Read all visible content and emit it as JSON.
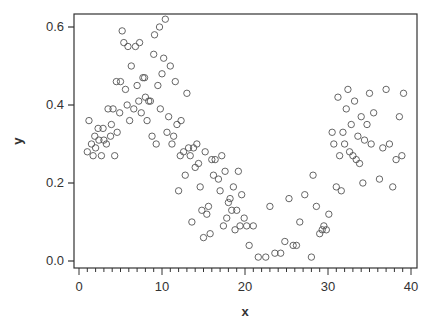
{
  "chart_data": {
    "type": "scatter",
    "title": "",
    "xlabel": "x",
    "ylabel": "y",
    "xlim": [
      -0.5,
      40.5
    ],
    "ylim": [
      -0.02,
      0.64
    ],
    "xticks": [
      0,
      10,
      20,
      30,
      40
    ],
    "xtick_labels": [
      "0",
      "10",
      "20",
      "30",
      "40"
    ],
    "yticks": [
      0.0,
      0.2,
      0.4,
      0.6
    ],
    "ytick_labels": [
      "0.0",
      "0.2",
      "0.4",
      "0.6"
    ],
    "x_minor_step": 1,
    "grid": false,
    "legend": null,
    "marker": "open-circle",
    "marker_color": "#555555",
    "points": [
      [
        1.0,
        0.28
      ],
      [
        1.2,
        0.36
      ],
      [
        1.5,
        0.3
      ],
      [
        1.7,
        0.27
      ],
      [
        1.9,
        0.32
      ],
      [
        2.0,
        0.29
      ],
      [
        2.3,
        0.34
      ],
      [
        2.4,
        0.31
      ],
      [
        2.7,
        0.27
      ],
      [
        2.9,
        0.34
      ],
      [
        3.0,
        0.31
      ],
      [
        3.3,
        0.3
      ],
      [
        3.5,
        0.39
      ],
      [
        3.8,
        0.32
      ],
      [
        3.9,
        0.35
      ],
      [
        4.1,
        0.39
      ],
      [
        4.3,
        0.27
      ],
      [
        4.5,
        0.46
      ],
      [
        4.6,
        0.33
      ],
      [
        4.9,
        0.38
      ],
      [
        5.0,
        0.46
      ],
      [
        5.2,
        0.59
      ],
      [
        5.4,
        0.56
      ],
      [
        5.6,
        0.44
      ],
      [
        5.8,
        0.4
      ],
      [
        5.9,
        0.55
      ],
      [
        6.1,
        0.36
      ],
      [
        6.3,
        0.5
      ],
      [
        6.6,
        0.39
      ],
      [
        6.8,
        0.55
      ],
      [
        7.0,
        0.45
      ],
      [
        7.2,
        0.41
      ],
      [
        7.3,
        0.56
      ],
      [
        7.5,
        0.38
      ],
      [
        7.7,
        0.47
      ],
      [
        7.9,
        0.47
      ],
      [
        8.0,
        0.42
      ],
      [
        8.2,
        0.36
      ],
      [
        8.4,
        0.41
      ],
      [
        8.6,
        0.41
      ],
      [
        8.8,
        0.32
      ],
      [
        9.0,
        0.53
      ],
      [
        9.1,
        0.58
      ],
      [
        9.3,
        0.3
      ],
      [
        9.5,
        0.45
      ],
      [
        9.7,
        0.6
      ],
      [
        9.8,
        0.39
      ],
      [
        10.0,
        0.48
      ],
      [
        10.2,
        0.52
      ],
      [
        10.4,
        0.62
      ],
      [
        10.6,
        0.33
      ],
      [
        10.8,
        0.37
      ],
      [
        11.0,
        0.5
      ],
      [
        11.2,
        0.3
      ],
      [
        11.4,
        0.32
      ],
      [
        11.6,
        0.46
      ],
      [
        11.8,
        0.35
      ],
      [
        12.0,
        0.18
      ],
      [
        12.2,
        0.27
      ],
      [
        12.3,
        0.36
      ],
      [
        12.6,
        0.28
      ],
      [
        12.8,
        0.22
      ],
      [
        13.0,
        0.43
      ],
      [
        13.2,
        0.29
      ],
      [
        13.4,
        0.27
      ],
      [
        13.6,
        0.1
      ],
      [
        13.8,
        0.29
      ],
      [
        14.0,
        0.24
      ],
      [
        14.2,
        0.3
      ],
      [
        14.4,
        0.25
      ],
      [
        14.6,
        0.19
      ],
      [
        14.8,
        0.13
      ],
      [
        15.0,
        0.06
      ],
      [
        15.2,
        0.28
      ],
      [
        15.4,
        0.12
      ],
      [
        15.6,
        0.14
      ],
      [
        15.8,
        0.07
      ],
      [
        16.0,
        0.26
      ],
      [
        16.2,
        0.22
      ],
      [
        16.4,
        0.26
      ],
      [
        16.8,
        0.21
      ],
      [
        17.0,
        0.18
      ],
      [
        17.2,
        0.27
      ],
      [
        17.4,
        0.09
      ],
      [
        17.6,
        0.23
      ],
      [
        17.8,
        0.11
      ],
      [
        18.0,
        0.15
      ],
      [
        18.2,
        0.16
      ],
      [
        18.4,
        0.13
      ],
      [
        18.6,
        0.19
      ],
      [
        18.8,
        0.08
      ],
      [
        19.0,
        0.13
      ],
      [
        19.2,
        0.23
      ],
      [
        19.4,
        0.09
      ],
      [
        19.6,
        0.17
      ],
      [
        19.9,
        0.11
      ],
      [
        20.2,
        0.09
      ],
      [
        20.5,
        0.04
      ],
      [
        21.0,
        0.09
      ],
      [
        21.6,
        0.01
      ],
      [
        22.5,
        0.01
      ],
      [
        23.0,
        0.14
      ],
      [
        23.6,
        0.02
      ],
      [
        24.3,
        0.02
      ],
      [
        24.8,
        0.05
      ],
      [
        25.3,
        0.16
      ],
      [
        25.8,
        0.04
      ],
      [
        26.2,
        0.04
      ],
      [
        26.6,
        0.1
      ],
      [
        27.2,
        0.17
      ],
      [
        28.0,
        0.01
      ],
      [
        28.2,
        0.22
      ],
      [
        28.6,
        0.14
      ],
      [
        29.0,
        0.07
      ],
      [
        29.3,
        0.08
      ],
      [
        29.5,
        0.09
      ],
      [
        29.8,
        0.08
      ],
      [
        30.1,
        0.12
      ],
      [
        30.5,
        0.33
      ],
      [
        30.7,
        0.3
      ],
      [
        31.0,
        0.19
      ],
      [
        31.2,
        0.42
      ],
      [
        31.4,
        0.27
      ],
      [
        31.6,
        0.18
      ],
      [
        31.8,
        0.33
      ],
      [
        32.0,
        0.3
      ],
      [
        32.2,
        0.39
      ],
      [
        32.4,
        0.44
      ],
      [
        32.6,
        0.28
      ],
      [
        32.8,
        0.35
      ],
      [
        33.0,
        0.27
      ],
      [
        33.2,
        0.41
      ],
      [
        33.4,
        0.26
      ],
      [
        33.6,
        0.32
      ],
      [
        33.8,
        0.25
      ],
      [
        34.0,
        0.37
      ],
      [
        34.2,
        0.2
      ],
      [
        34.4,
        0.31
      ],
      [
        34.7,
        0.35
      ],
      [
        35.0,
        0.43
      ],
      [
        35.2,
        0.3
      ],
      [
        35.5,
        0.38
      ],
      [
        36.2,
        0.21
      ],
      [
        36.6,
        0.29
      ],
      [
        37.0,
        0.44
      ],
      [
        37.4,
        0.3
      ],
      [
        37.8,
        0.19
      ],
      [
        38.2,
        0.26
      ],
      [
        38.6,
        0.37
      ],
      [
        38.9,
        0.27
      ],
      [
        39.1,
        0.43
      ]
    ]
  }
}
